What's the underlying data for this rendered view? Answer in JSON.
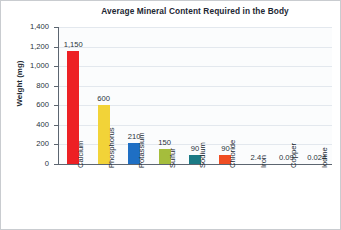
{
  "chart_data": {
    "type": "bar",
    "title": "Average Mineral Content Required in the Body",
    "xlabel": "",
    "ylabel": "Weight (mg)",
    "ylim": [
      0,
      1400
    ],
    "ytick_labels": [
      "1,400",
      "1,200",
      "1,000",
      "800",
      "600",
      "400",
      "200",
      "0"
    ],
    "ytick_values": [
      1400,
      1200,
      1000,
      800,
      600,
      400,
      200,
      0
    ],
    "grid": true,
    "legend": "none",
    "categories": [
      "Calcium",
      "Phosphorus",
      "Potassium",
      "Sulfur",
      "Sodium",
      "Chloride",
      "Iron",
      "Copper",
      "Iodine"
    ],
    "values": [
      1150,
      600,
      210,
      150,
      90,
      90,
      2.4,
      0.09,
      0.024
    ],
    "value_labels": [
      "1,150",
      "600",
      "210",
      "150",
      "90",
      "90",
      "2.4",
      "0.09",
      "0.024"
    ],
    "bar_colors": [
      "#ED2024",
      "#F2D338",
      "#1F6FC4",
      "#A5BD3C",
      "#1B7A85",
      "#F04E23",
      "#ED2024",
      "#F2D338",
      "#1F6FC4"
    ]
  }
}
